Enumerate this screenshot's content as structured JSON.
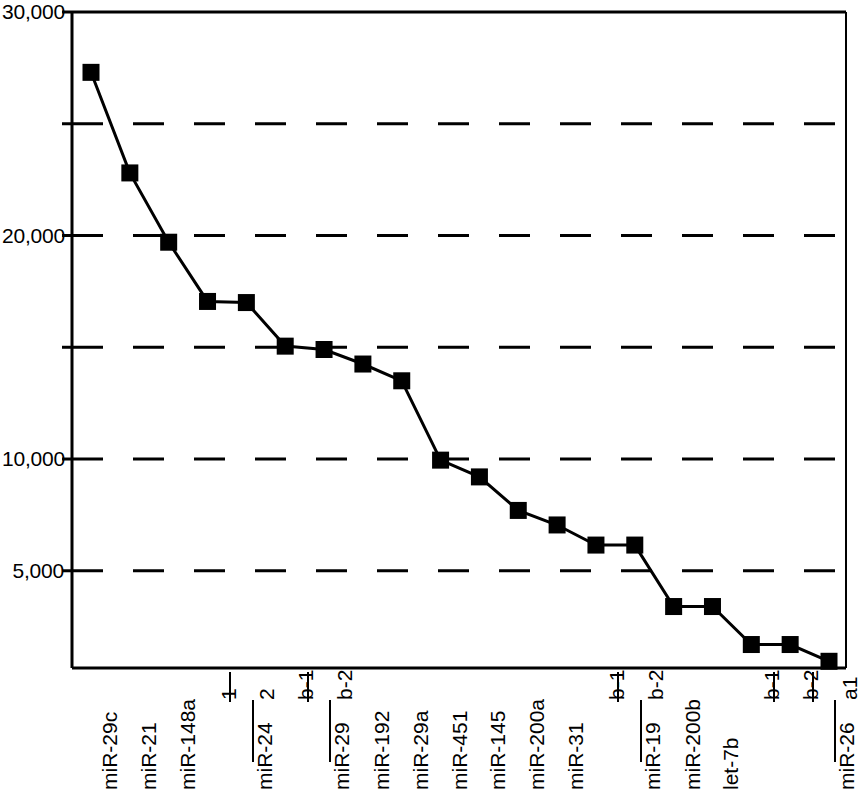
{
  "chart_data": {
    "type": "line",
    "title": "",
    "xlabel": "",
    "ylabel": "",
    "ylim": [
      0,
      30000
    ],
    "grid": true,
    "legend": null,
    "y_ticks": [
      {
        "value": 30000,
        "label": "30,000",
        "labeled": true
      },
      {
        "value": 25000,
        "label": "",
        "labeled": false
      },
      {
        "value": 20000,
        "label": "20,000",
        "labeled": true
      },
      {
        "value": 15000,
        "label": "",
        "labeled": false
      },
      {
        "value": 10000,
        "label": "10,000",
        "labeled": true
      },
      {
        "value": 5000,
        "label": "5,000",
        "labeled": true
      }
    ],
    "categories": [
      "miR-29c",
      "miR-21",
      "miR-148a",
      "miR-24 1",
      "miR-24 2",
      "miR-29b-1",
      "miR-29b-2",
      "miR-192",
      "miR-29a",
      "miR-451",
      "miR-145",
      "miR-200a",
      "miR-31",
      "miR-19b-1",
      "miR-19b-2",
      "miR-200b",
      "let-7b",
      "miR-26b-1",
      "miR-26b-2",
      "miR-26a1"
    ],
    "values": [
      27300,
      22800,
      19700,
      17050,
      17000,
      15050,
      14900,
      14250,
      13500,
      9950,
      9200,
      7700,
      7050,
      6150,
      6150,
      3400,
      3400,
      1700,
      1700,
      950
    ],
    "marker": "square",
    "series_color": "#000000"
  },
  "x_axis": {
    "groups": [
      {
        "name": "miR-29c",
        "subs": []
      },
      {
        "name": "miR-21",
        "subs": []
      },
      {
        "name": "miR-148a",
        "subs": []
      },
      {
        "name": "miR-24",
        "subs": [
          "1",
          "2"
        ]
      },
      {
        "name": "miR-29",
        "subs": [
          "b-1",
          "b-2"
        ]
      },
      {
        "name": "miR-192",
        "subs": []
      },
      {
        "name": "miR-29a",
        "subs": []
      },
      {
        "name": "miR-451",
        "subs": []
      },
      {
        "name": "miR-145",
        "subs": []
      },
      {
        "name": "miR-200a",
        "subs": []
      },
      {
        "name": "miR-31",
        "subs": []
      },
      {
        "name": "miR-19",
        "subs": [
          "b-1",
          "b-2"
        ]
      },
      {
        "name": "miR-200b",
        "subs": []
      },
      {
        "name": "let-7b",
        "subs": []
      },
      {
        "name": "miR-26",
        "subs": [
          "b-1",
          "b-2",
          "a1"
        ]
      }
    ]
  },
  "colors": {
    "axis": "#000000",
    "grid": "#000000",
    "line": "#000000",
    "marker": "#000000",
    "background": "#ffffff"
  }
}
